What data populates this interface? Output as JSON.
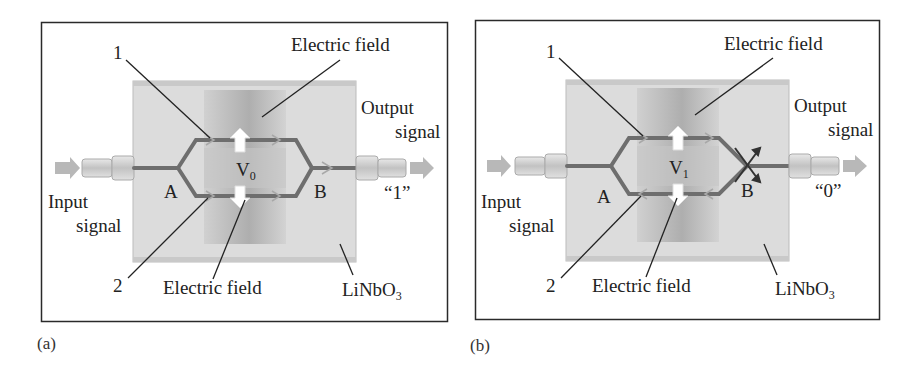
{
  "figure": {
    "panels": [
      {
        "id": "a",
        "caption": "(a)",
        "waveguide_label_1": "1",
        "waveguide_label_2": "2",
        "electric_field_top": "Electric field",
        "electric_field_bottom": "Electric field",
        "voltage_symbol": "V",
        "voltage_subscript": "0",
        "junction_a": "A",
        "junction_b": "B",
        "input_line1": "Input",
        "input_line2": "signal",
        "output_line1": "Output",
        "output_line2": "signal",
        "output_value": "“1”",
        "substrate": "LiNbO",
        "substrate_subscript": "3",
        "lower_arm_direction": "forward",
        "output_state": "constructive"
      },
      {
        "id": "b",
        "caption": "(b)",
        "waveguide_label_1": "1",
        "waveguide_label_2": "2",
        "electric_field_top": "Electric field",
        "electric_field_bottom": "Electric field",
        "voltage_symbol": "V",
        "voltage_subscript": "1",
        "junction_a": "A",
        "junction_b": "B",
        "input_line1": "Input",
        "input_line2": "signal",
        "output_line1": "Output",
        "output_line2": "signal",
        "output_value": "“0”",
        "substrate": "LiNbO",
        "substrate_subscript": "3",
        "lower_arm_direction": "reversed",
        "output_state": "destructive"
      }
    ],
    "colors": {
      "frame": "#2a2a2a",
      "substrate": "#d9d9d9",
      "electrode": "#bdbdbd",
      "waveguide": "#6e6e6e",
      "arrow": "#b5b5b5",
      "field_arrow": "#ffffff",
      "text": "#222222"
    }
  }
}
